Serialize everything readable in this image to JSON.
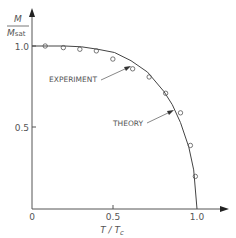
{
  "chart_data": {
    "type": "line",
    "title": "",
    "xlabel": "T/Tc",
    "ylabel": "M/Msat",
    "ylabel_num": "M",
    "ylabel_den": "Msat",
    "xlim": [
      0,
      1.2
    ],
    "ylim": [
      0,
      1.25
    ],
    "x_ticks": [
      "0",
      "0.5",
      "1.0"
    ],
    "y_ticks": [
      "0.5",
      "1.0"
    ],
    "grid": false,
    "series": [
      {
        "name": "Theory",
        "kind": "curve",
        "x": [
          0,
          0.1,
          0.2,
          0.3,
          0.4,
          0.5,
          0.6,
          0.7,
          0.8,
          0.85,
          0.9,
          0.95,
          0.98,
          1.0
        ],
        "y": [
          1.0,
          1.0,
          1.0,
          0.995,
          0.98,
          0.96,
          0.91,
          0.84,
          0.72,
          0.64,
          0.53,
          0.38,
          0.24,
          0.0
        ]
      },
      {
        "name": "Experiment",
        "kind": "markers",
        "x": [
          0.08,
          0.19,
          0.29,
          0.39,
          0.49,
          0.61,
          0.71,
          0.81,
          0.9,
          0.96,
          0.99
        ],
        "y": [
          1.0,
          0.99,
          0.98,
          0.97,
          0.92,
          0.86,
          0.81,
          0.71,
          0.59,
          0.39,
          0.2
        ]
      }
    ],
    "annotations": [
      {
        "text": "EXPERIMENT",
        "points_to": [
          0.6,
          0.86
        ]
      },
      {
        "text": "THEORY",
        "points_to": [
          0.9,
          0.6
        ]
      }
    ]
  }
}
